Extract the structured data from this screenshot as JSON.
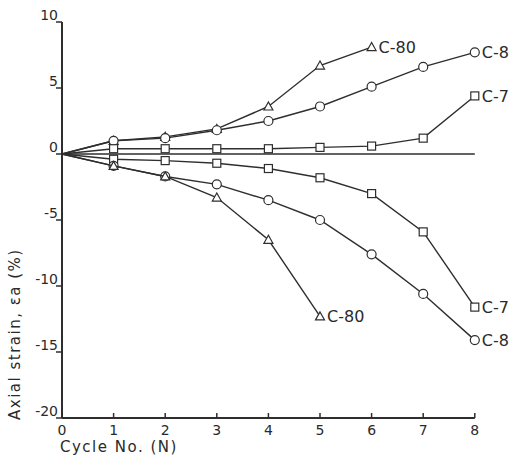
{
  "chart_data": {
    "type": "line",
    "title": "",
    "xlabel": "Cycle No. (N)",
    "ylabel": "Axial strain, εa (%)",
    "xlim": [
      0,
      8
    ],
    "ylim": [
      -20,
      10
    ],
    "x_ticks": [
      0,
      1,
      2,
      3,
      4,
      5,
      6,
      7,
      8
    ],
    "y_ticks": [
      10,
      5,
      0,
      -5,
      -10,
      -15,
      -20
    ],
    "grid": false,
    "reference_line": {
      "y": 0,
      "x_range": [
        0,
        8
      ]
    },
    "series": [
      {
        "name": "C-80",
        "branch": "upper",
        "marker": "triangle",
        "x": [
          0,
          1,
          2,
          3,
          4,
          5,
          6
        ],
        "values": [
          0,
          1.0,
          1.3,
          1.9,
          3.6,
          6.7,
          8.1
        ]
      },
      {
        "name": "C-8",
        "branch": "upper",
        "marker": "circle",
        "x": [
          0,
          1,
          2,
          3,
          4,
          5,
          6,
          7,
          8
        ],
        "values": [
          0,
          1.0,
          1.2,
          1.8,
          2.5,
          3.6,
          5.1,
          6.6,
          7.7
        ]
      },
      {
        "name": "C-7",
        "branch": "upper",
        "marker": "square",
        "x": [
          0,
          1,
          2,
          3,
          4,
          5,
          6,
          7,
          8
        ],
        "values": [
          0,
          0.4,
          0.4,
          0.4,
          0.4,
          0.5,
          0.6,
          1.2,
          4.4
        ]
      },
      {
        "name": "C-7",
        "branch": "lower",
        "marker": "square",
        "x": [
          0,
          1,
          2,
          3,
          4,
          5,
          6,
          7,
          8
        ],
        "values": [
          0,
          -0.4,
          -0.5,
          -0.7,
          -1.1,
          -1.8,
          -3.0,
          -5.9,
          -11.6
        ]
      },
      {
        "name": "C-8",
        "branch": "lower",
        "marker": "circle",
        "x": [
          0,
          1,
          2,
          3,
          4,
          5,
          6,
          7,
          8
        ],
        "values": [
          0,
          -0.9,
          -1.7,
          -2.3,
          -3.5,
          -5.0,
          -7.6,
          -10.6,
          -14.1
        ]
      },
      {
        "name": "C-80",
        "branch": "lower",
        "marker": "triangle",
        "x": [
          0,
          1,
          2,
          3,
          4,
          5
        ],
        "values": [
          0,
          -0.9,
          -1.7,
          -3.3,
          -6.5,
          -12.3
        ]
      }
    ],
    "labels": [
      {
        "text": "C-80",
        "series_index": 0
      },
      {
        "text": "C-8",
        "series_index": 1
      },
      {
        "text": "C-7",
        "series_index": 2
      },
      {
        "text": "C-7",
        "series_index": 3
      },
      {
        "text": "C-8",
        "series_index": 4
      },
      {
        "text": "C-80",
        "series_index": 5
      }
    ],
    "colors": {
      "line": "#2e2e2e",
      "background": "#ffffff"
    }
  }
}
